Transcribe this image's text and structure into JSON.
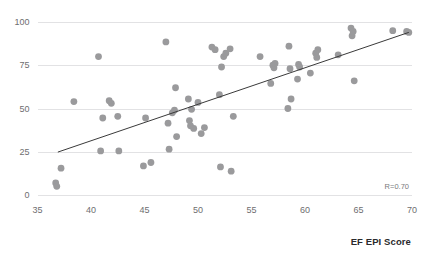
{
  "chart_data": {
    "type": "scatter",
    "title": "",
    "xlabel": "EF EPI Score",
    "ylabel": "",
    "xlim": [
      35,
      70
    ],
    "ylim": [
      0,
      100
    ],
    "xticks": [
      35,
      40,
      45,
      50,
      55,
      60,
      65,
      70
    ],
    "yticks": [
      0,
      25,
      50,
      75,
      100
    ],
    "grid": "horizontal",
    "legend": "none",
    "annotation": "R=0.70",
    "correlation": 0.7,
    "marker_color": "#9a9a9c",
    "trendline_color": "#3a3a3a",
    "gridline_color": "#e2e2e4",
    "trendline": {
      "x0": 36.9,
      "y0": 24.8,
      "x1": 69.7,
      "y1": 94.0
    },
    "points": [
      {
        "x": 36.7,
        "y": 7.0
      },
      {
        "x": 36.8,
        "y": 5.0
      },
      {
        "x": 37.2,
        "y": 15.5
      },
      {
        "x": 38.4,
        "y": 54.0
      },
      {
        "x": 40.7,
        "y": 80.0
      },
      {
        "x": 40.9,
        "y": 25.5
      },
      {
        "x": 41.1,
        "y": 44.5
      },
      {
        "x": 41.7,
        "y": 54.5
      },
      {
        "x": 41.9,
        "y": 53.0
      },
      {
        "x": 42.5,
        "y": 45.5
      },
      {
        "x": 42.6,
        "y": 25.5
      },
      {
        "x": 44.9,
        "y": 16.8
      },
      {
        "x": 45.1,
        "y": 44.5
      },
      {
        "x": 45.6,
        "y": 18.8
      },
      {
        "x": 47.0,
        "y": 88.5
      },
      {
        "x": 47.2,
        "y": 41.5
      },
      {
        "x": 47.3,
        "y": 26.5
      },
      {
        "x": 47.6,
        "y": 47.5
      },
      {
        "x": 47.8,
        "y": 49.0
      },
      {
        "x": 47.9,
        "y": 62.0
      },
      {
        "x": 48.0,
        "y": 33.8
      },
      {
        "x": 49.1,
        "y": 55.5
      },
      {
        "x": 49.2,
        "y": 43.0
      },
      {
        "x": 49.3,
        "y": 40.0
      },
      {
        "x": 49.4,
        "y": 49.5
      },
      {
        "x": 49.6,
        "y": 38.5
      },
      {
        "x": 50.0,
        "y": 53.5
      },
      {
        "x": 50.3,
        "y": 35.5
      },
      {
        "x": 50.6,
        "y": 39.0
      },
      {
        "x": 51.3,
        "y": 85.5
      },
      {
        "x": 51.6,
        "y": 84.0
      },
      {
        "x": 52.0,
        "y": 58.0
      },
      {
        "x": 52.1,
        "y": 16.2
      },
      {
        "x": 52.2,
        "y": 74.0
      },
      {
        "x": 52.4,
        "y": 80.0
      },
      {
        "x": 52.6,
        "y": 82.0
      },
      {
        "x": 53.0,
        "y": 84.5
      },
      {
        "x": 53.1,
        "y": 13.8
      },
      {
        "x": 53.3,
        "y": 45.5
      },
      {
        "x": 55.8,
        "y": 80.0
      },
      {
        "x": 56.8,
        "y": 64.5
      },
      {
        "x": 57.0,
        "y": 75.0
      },
      {
        "x": 57.1,
        "y": 73.5
      },
      {
        "x": 57.2,
        "y": 76.0
      },
      {
        "x": 58.4,
        "y": 50.0
      },
      {
        "x": 58.5,
        "y": 86.0
      },
      {
        "x": 58.6,
        "y": 73.0
      },
      {
        "x": 58.7,
        "y": 55.5
      },
      {
        "x": 59.3,
        "y": 67.0
      },
      {
        "x": 59.4,
        "y": 75.5
      },
      {
        "x": 59.5,
        "y": 74.0
      },
      {
        "x": 60.5,
        "y": 70.5
      },
      {
        "x": 61.0,
        "y": 82.0
      },
      {
        "x": 61.1,
        "y": 79.5
      },
      {
        "x": 61.2,
        "y": 84.0
      },
      {
        "x": 63.1,
        "y": 81.0
      },
      {
        "x": 64.3,
        "y": 96.5
      },
      {
        "x": 64.4,
        "y": 92.0
      },
      {
        "x": 64.5,
        "y": 94.5
      },
      {
        "x": 64.6,
        "y": 66.0
      },
      {
        "x": 68.2,
        "y": 95.0
      },
      {
        "x": 69.5,
        "y": 94.5
      },
      {
        "x": 69.7,
        "y": 94.0
      }
    ]
  },
  "axis_title": "EF EPI Score",
  "annotation_label": "R=0.70",
  "top_cropped_text": ""
}
